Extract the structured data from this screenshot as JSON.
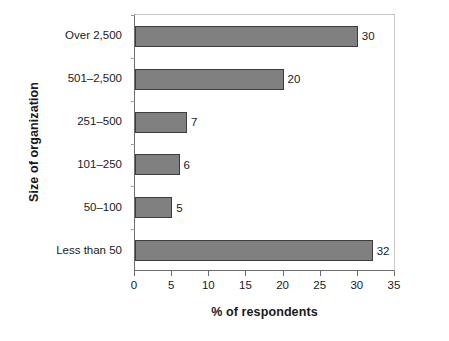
{
  "chart_data": {
    "type": "bar",
    "orientation": "horizontal",
    "title": "",
    "xlabel": "% of respondents",
    "ylabel": "Size of organization",
    "categories": [
      "Less than 50",
      "50–100",
      "101–250",
      "251–500",
      "501–2,500",
      "Over 2,500"
    ],
    "values": [
      32,
      5,
      6,
      7,
      20,
      30
    ],
    "data_labels": [
      "32",
      "5",
      "6",
      "7",
      "20",
      "30"
    ],
    "xlim": [
      0,
      35
    ],
    "xticks": [
      0,
      5,
      10,
      15,
      20,
      25,
      30,
      35
    ],
    "xtick_labels": [
      "0",
      "5",
      "10",
      "15",
      "20",
      "25",
      "30",
      "35"
    ],
    "grid": false,
    "legend": false,
    "bar_fill_color": "#808080",
    "bar_border_color": "#3d3d3d",
    "axis_color": "#6e6e6e",
    "text_color": "#1a1a1a"
  }
}
